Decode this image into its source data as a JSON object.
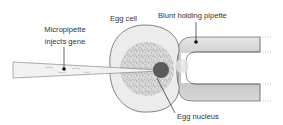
{
  "diagram": {
    "title": "",
    "labels": {
      "micropipette_line1": "Micropipette",
      "micropipette_line2": "injects gene",
      "egg_cell": "Egg cell",
      "holding_pipette": "Blunt holding pipette",
      "egg_nucleus": "Egg nucleus"
    },
    "colors": {
      "outline": "#555555",
      "cell_fill": "#ececec",
      "granular": "#9a9a9a",
      "nucleus": "#5a5a5a",
      "pipette_fill": "#c8c8c8",
      "leader": "#222222",
      "text": "#333333"
    }
  }
}
